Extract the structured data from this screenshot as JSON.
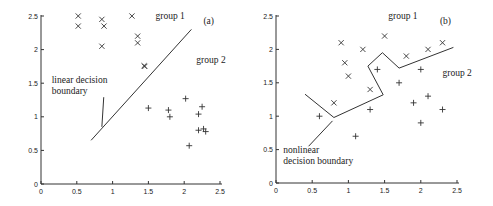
{
  "chart_data": [
    {
      "type": "scatter",
      "panel_label": "(a)",
      "title": "",
      "xlabel": "",
      "ylabel": "",
      "xlim": [
        0,
        2.5
      ],
      "ylim": [
        0,
        2.5
      ],
      "xticks": [
        "0",
        "0.5",
        "1",
        "1.5",
        "2",
        "2.5"
      ],
      "yticks": [
        "0",
        "0.5",
        "1",
        "1.5",
        "2",
        "2.5"
      ],
      "grid": false,
      "series": [
        {
          "name": "group 1",
          "marker": "x",
          "points": [
            [
              0.52,
              2.5
            ],
            [
              0.52,
              2.35
            ],
            [
              0.85,
              2.45
            ],
            [
              0.88,
              2.35
            ],
            [
              0.85,
              2.05
            ],
            [
              1.27,
              2.5
            ],
            [
              1.35,
              2.2
            ],
            [
              1.35,
              2.1
            ],
            [
              1.45,
              1.75
            ],
            [
              1.44,
              1.76
            ]
          ]
        },
        {
          "name": "group 2",
          "marker": "+",
          "points": [
            [
              1.5,
              1.13
            ],
            [
              1.78,
              1.1
            ],
            [
              1.8,
              1.0
            ],
            [
              2.02,
              1.27
            ],
            [
              2.07,
              0.57
            ],
            [
              2.2,
              1.04
            ],
            [
              2.2,
              0.8
            ],
            [
              2.25,
              1.15
            ],
            [
              2.27,
              0.82
            ],
            [
              2.3,
              0.78
            ]
          ]
        }
      ],
      "boundary": {
        "name": "linear decision boundary",
        "points": [
          [
            0.7,
            0.65
          ],
          [
            2.1,
            2.3
          ]
        ]
      },
      "annotations": [
        {
          "text": "group 1",
          "x": 1.6,
          "y": 2.45
        },
        {
          "text": "group 2",
          "x": 2.17,
          "y": 1.8
        },
        {
          "text_lines": [
            "linear decision",
            "boundary"
          ],
          "x": 0.15,
          "y": 1.5,
          "pointer_to": [
            0.85,
            0.85
          ]
        }
      ]
    },
    {
      "type": "scatter",
      "panel_label": "(b)",
      "title": "",
      "xlabel": "",
      "ylabel": "",
      "xlim": [
        0,
        2.5
      ],
      "ylim": [
        0,
        2.5
      ],
      "xticks": [
        "0",
        "0.5",
        "1",
        "1.5",
        "2",
        "2.5"
      ],
      "yticks": [
        "0",
        "0.5",
        "1",
        "1.5",
        "2",
        "2.5"
      ],
      "grid": false,
      "series": [
        {
          "name": "group 1",
          "marker": "x",
          "points": [
            [
              0.8,
              1.2
            ],
            [
              0.9,
              2.1
            ],
            [
              0.95,
              1.8
            ],
            [
              1.0,
              1.6
            ],
            [
              1.2,
              2.0
            ],
            [
              1.3,
              1.4
            ],
            [
              1.5,
              2.2
            ],
            [
              1.8,
              1.9
            ],
            [
              2.1,
              2.0
            ],
            [
              2.3,
              2.1
            ]
          ]
        },
        {
          "name": "group 2",
          "marker": "+",
          "points": [
            [
              0.6,
              1.0
            ],
            [
              1.1,
              0.7
            ],
            [
              1.3,
              1.1
            ],
            [
              1.4,
              1.7
            ],
            [
              1.7,
              1.5
            ],
            [
              1.9,
              1.2
            ],
            [
              2.0,
              1.7
            ],
            [
              2.0,
              0.9
            ],
            [
              2.1,
              1.3
            ],
            [
              2.3,
              1.1
            ]
          ]
        }
      ],
      "boundary": {
        "name": "nonlinear decision boundary",
        "points": [
          [
            0.4,
            1.33
          ],
          [
            0.8,
            0.98
          ],
          [
            1.48,
            1.32
          ],
          [
            1.27,
            1.75
          ],
          [
            1.47,
            1.95
          ],
          [
            1.7,
            1.72
          ],
          [
            2.45,
            2.03
          ]
        ]
      },
      "annotations": [
        {
          "text": "group 1",
          "x": 1.55,
          "y": 2.45
        },
        {
          "text": "group 2",
          "x": 2.3,
          "y": 1.6
        },
        {
          "text_lines": [
            "nonlinear",
            "decision boundary"
          ],
          "x": 0.1,
          "y": 0.45,
          "pointer_from": [
            0.45,
            0.55
          ],
          "pointer_to": [
            0.78,
            0.93
          ]
        }
      ]
    }
  ]
}
